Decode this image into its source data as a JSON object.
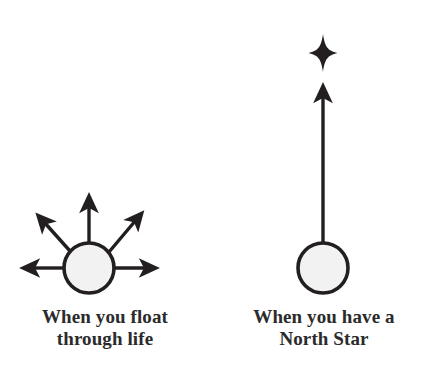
{
  "figure": {
    "background_color": "#ffffff",
    "ink_color": "#231f20",
    "circle_fill": "#f2f2f2"
  },
  "panels": {
    "left": {
      "caption_line1": "When you float",
      "caption_line2": "through life",
      "caption_text": "When you float\nthrough life",
      "circle": {
        "cx": 89,
        "cy": 268,
        "r": 25
      },
      "arrows": [
        {
          "name": "arrow-left",
          "angle_deg": 180,
          "x1": 64,
          "y1": 268,
          "x2": 30,
          "y2": 268
        },
        {
          "name": "arrow-up-left",
          "angle_deg": 142,
          "x1": 69,
          "y1": 250,
          "x2": 41,
          "y2": 219
        },
        {
          "name": "arrow-up",
          "angle_deg": 90,
          "x1": 89,
          "y1": 243,
          "x2": 89,
          "y2": 202
        },
        {
          "name": "arrow-up-right",
          "angle_deg": 41,
          "x1": 110,
          "y1": 251,
          "x2": 139,
          "y2": 216
        },
        {
          "name": "arrow-right",
          "angle_deg": 0,
          "x1": 114,
          "y1": 268,
          "x2": 150,
          "y2": 268
        }
      ],
      "arrow_count": 5
    },
    "right": {
      "caption_line1": "When you have a",
      "caption_line2": "North Star",
      "caption_text": "When you have a\nNorth Star",
      "circle": {
        "cx": 323,
        "cy": 268,
        "r": 25
      },
      "arrows": [
        {
          "name": "arrow-up-to-star",
          "angle_deg": 90,
          "x1": 323,
          "y1": 243,
          "x2": 323,
          "y2": 92
        }
      ],
      "arrow_count": 1,
      "star": {
        "name": "north-star",
        "cx": 323,
        "cy": 53,
        "points": 4,
        "outer_v": 19,
        "outer_h": 14
      }
    }
  }
}
